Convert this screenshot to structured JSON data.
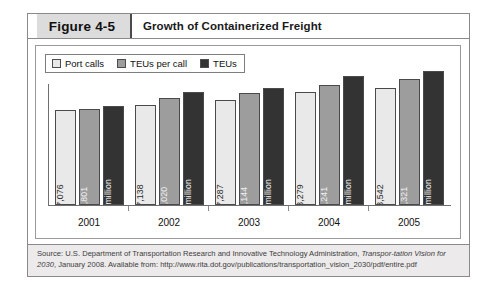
{
  "figure": {
    "number_label": "Figure 4-5",
    "title": "Growth of Containerized Freight"
  },
  "legend": {
    "items": [
      {
        "label": "Port calls",
        "color": "#e9e9e9",
        "swatch_name": "legend-swatch-port-calls"
      },
      {
        "label": "TEUs per call",
        "color": "#9d9d9d",
        "swatch_name": "legend-swatch-teus-per-call"
      },
      {
        "label": "TEUs",
        "color": "#333333",
        "swatch_name": "legend-swatch-teus"
      }
    ]
  },
  "chart_data": {
    "type": "bar",
    "title": "Growth of Containerized Freight",
    "xlabel": "",
    "ylabel": "",
    "grid": false,
    "legend_position": "top-left",
    "categories": [
      "2001",
      "2002",
      "2003",
      "2004",
      "2005"
    ],
    "series": [
      {
        "name": "Port calls",
        "color": "#e9e9e9",
        "values": [
          17076,
          17138,
          17287,
          18279,
          18542
        ],
        "labels": [
          "17,076",
          "17,138",
          "17,287",
          "18,279",
          "18,542"
        ],
        "bar_heights_px": [
          95,
          100,
          105,
          113,
          117
        ]
      },
      {
        "name": "TEUs per call",
        "color": "#9d9d9d",
        "values": [
          2801,
          3020,
          3144,
          3241,
          3321
        ],
        "labels": [
          "2,801",
          "3,020",
          "3,144",
          "3,241",
          "3,321"
        ],
        "bar_heights_px": [
          96,
          107,
          112,
          120,
          126
        ]
      },
      {
        "name": "TEUs",
        "color": "#333333",
        "values": [
          48,
          52,
          54,
          59,
          62
        ],
        "unit": "million",
        "labels": [
          "48 million",
          "52 million",
          "54 million",
          "59 million",
          "62 million"
        ],
        "bar_heights_px": [
          99,
          113,
          117,
          129,
          134
        ]
      }
    ]
  },
  "source": {
    "line1_a": "Source: U.S. Department of Transportation Research and Innovative Technology Administration, ",
    "line1_italic": "Transpor-",
    "line2_italic": "tation Vision for 2030",
    "line2_b": ", January 2008. Available from: http://www.rita.dot.gov/publications/transportation_",
    "line3": "vision_2030/pdf/entire.pdf"
  }
}
